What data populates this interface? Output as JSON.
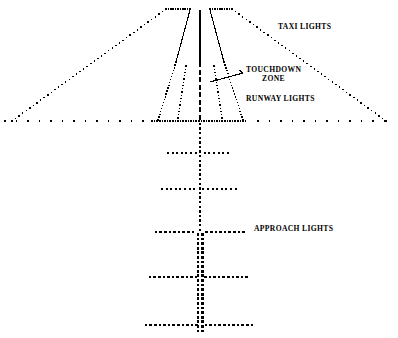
{
  "figure": {
    "background_color": "#ffffff",
    "ink_color": "#000000",
    "width": 398,
    "height": 338
  },
  "labels": {
    "taxi_lights": "TAXI LIGHTS",
    "touchdown_zone_line1": "TOUCHDOWN",
    "touchdown_zone_line2": "ZONE",
    "runway_lights": "RUNWAY LIGHTS",
    "approach_lights": "APPROACH LIGHTS"
  },
  "chart_data": {
    "type": "diagram",
    "xlabel": "",
    "ylabel": "",
    "xlim": [
      0,
      398
    ],
    "ylim": [
      0,
      338
    ],
    "grid": false,
    "legend": "inline-callouts",
    "elements": [
      {
        "name": "runway-threshold-line",
        "kind": "dotted-horizontal",
        "y": 121,
        "x_start": 5,
        "x_end": 393,
        "note": "full width threshold row, denser between x=152 and x=248"
      },
      {
        "name": "taxi-light-left-diagonal",
        "kind": "dotted-line",
        "from": [
          12,
          121
        ],
        "to": [
          166,
          9
        ]
      },
      {
        "name": "taxi-light-right-diagonal",
        "kind": "dotted-line",
        "from": [
          386,
          121
        ],
        "to": [
          232,
          9
        ]
      },
      {
        "name": "taxi-apron-top-left",
        "kind": "dotted-line",
        "from": [
          166,
          9
        ],
        "to": [
          190,
          9
        ]
      },
      {
        "name": "taxi-apron-top-right",
        "kind": "dotted-line",
        "from": [
          210,
          9
        ],
        "to": [
          232,
          9
        ]
      },
      {
        "name": "runway-edge-left-solid",
        "kind": "solid-line",
        "from": [
          190,
          10
        ],
        "to": [
          176,
          62
        ]
      },
      {
        "name": "runway-edge-right-solid",
        "kind": "solid-line",
        "from": [
          210,
          10
        ],
        "to": [
          224,
          62
        ]
      },
      {
        "name": "runway-edge-left-dotted",
        "kind": "dotted-line",
        "from": [
          176,
          62
        ],
        "to": [
          158,
          120
        ]
      },
      {
        "name": "runway-edge-right-dotted",
        "kind": "dotted-line",
        "from": [
          224,
          62
        ],
        "to": [
          243,
          120
        ]
      },
      {
        "name": "runway-centerline-upper-solid",
        "kind": "solid-line",
        "from": [
          200,
          10
        ],
        "to": [
          200,
          62
        ]
      },
      {
        "name": "runway-centerline-lower-dashed",
        "kind": "dashed-line",
        "from": [
          200,
          62
        ],
        "to": [
          200,
          121
        ]
      },
      {
        "name": "touchdown-zone-marker-left",
        "kind": "dotted-line",
        "from": [
          186,
          66
        ],
        "to": [
          178,
          118
        ]
      },
      {
        "name": "touchdown-zone-marker-right",
        "kind": "dotted-line",
        "from": [
          214,
          66
        ],
        "to": [
          222,
          118
        ]
      },
      {
        "name": "touchdown-zone-leader",
        "kind": "solid-line",
        "from": [
          210,
          82
        ],
        "to": [
          243,
          73
        ]
      },
      {
        "name": "approach-centerline",
        "kind": "dotted-vertical",
        "x": 200,
        "y_start": 121,
        "y_end": 332,
        "note": "single-width above y=232, double-width below"
      },
      {
        "name": "approach-bar-1",
        "kind": "dotted-horizontal",
        "y": 153,
        "x_start": 168,
        "x_end": 232,
        "half_width": 32
      },
      {
        "name": "approach-bar-2",
        "kind": "dotted-horizontal",
        "y": 189,
        "x_start": 162,
        "x_end": 238,
        "half_width": 38
      },
      {
        "name": "approach-bar-3",
        "kind": "dotted-horizontal",
        "y": 232,
        "x_start": 156,
        "x_end": 244,
        "half_width": 44
      },
      {
        "name": "approach-bar-4",
        "kind": "dotted-horizontal",
        "y": 277,
        "x_start": 150,
        "x_end": 250,
        "half_width": 50
      },
      {
        "name": "approach-bar-5",
        "kind": "dotted-horizontal",
        "y": 325,
        "x_start": 146,
        "x_end": 254,
        "half_width": 54
      }
    ],
    "annotations": [
      {
        "text": "TAXI LIGHTS",
        "x": 278,
        "y": 27,
        "anchor": "start"
      },
      {
        "text": "TOUCHDOWN",
        "x": 247,
        "y": 70,
        "anchor": "start"
      },
      {
        "text": "ZONE",
        "x": 263,
        "y": 79,
        "anchor": "start"
      },
      {
        "text": "RUNWAY LIGHTS",
        "x": 247,
        "y": 99,
        "anchor": "start"
      },
      {
        "text": "APPROACH LIGHTS",
        "x": 254,
        "y": 229,
        "anchor": "start"
      }
    ]
  }
}
